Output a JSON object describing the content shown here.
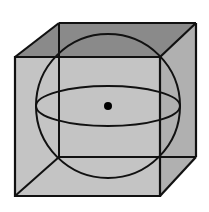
{
  "diagram": {
    "colors": {
      "background": "#ffffff",
      "front_face": "#c4c4c4",
      "top_face": "#8a8a8a",
      "right_face": "#b0b0b0",
      "stroke": "#111111",
      "center_dot": "#000000"
    },
    "shapes": {
      "cube": "cube-outline",
      "sphere": "sphere",
      "equator": "equator-ellipse",
      "center": "center-point"
    }
  }
}
